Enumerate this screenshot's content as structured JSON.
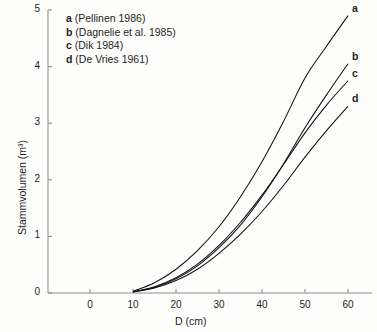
{
  "chart_data": {
    "type": "line",
    "title": "",
    "xlabel": "D (cm)",
    "ylabel": "Stammvolumen (m³)",
    "xlim": [
      0,
      65
    ],
    "ylim": [
      0,
      5
    ],
    "xticks": [
      0,
      10,
      20,
      30,
      40,
      50,
      60
    ],
    "yticks": [
      0,
      1,
      2,
      3,
      4,
      5
    ],
    "xtick_labels": [
      "0",
      "10",
      "20",
      "30",
      "40",
      "50",
      "60"
    ],
    "ytick_labels": [
      "0",
      "1",
      "2",
      "3",
      "4",
      "5"
    ],
    "grid": false,
    "legend_position": "upper-left",
    "x": [
      10,
      15,
      20,
      25,
      30,
      35,
      40,
      45,
      50,
      55,
      60
    ],
    "series": [
      {
        "name": "a",
        "label": "Pellinen 1986",
        "end_label": "a",
        "values": [
          0.03,
          0.18,
          0.42,
          0.75,
          1.17,
          1.7,
          2.32,
          3.03,
          3.8,
          4.36,
          4.9
        ]
      },
      {
        "name": "b",
        "label": "Dagnelie et al. 1985",
        "end_label": "b",
        "values": [
          0.02,
          0.1,
          0.25,
          0.48,
          0.8,
          1.2,
          1.7,
          2.28,
          2.92,
          3.5,
          4.05
        ]
      },
      {
        "name": "c",
        "label": "Dik 1984",
        "end_label": "c",
        "values": [
          0.02,
          0.11,
          0.27,
          0.51,
          0.84,
          1.25,
          1.73,
          2.27,
          2.83,
          3.32,
          3.75
        ]
      },
      {
        "name": "d",
        "label": "De Vries 1961",
        "end_label": "d",
        "values": [
          0.02,
          0.09,
          0.22,
          0.42,
          0.7,
          1.04,
          1.44,
          1.9,
          2.4,
          2.87,
          3.3
        ]
      }
    ]
  },
  "legend": {
    "entries": [
      {
        "key": "a",
        "ref": "(Pellinen 1986)"
      },
      {
        "key": "b",
        "ref": "(Dagnelie et al. 1985)"
      },
      {
        "key": "c",
        "ref": "(Dik 1984)"
      },
      {
        "key": "d",
        "ref": "(De Vries 1961)"
      }
    ]
  },
  "axes": {
    "y_title": "Stammvolumen (m³)",
    "x_title": "D (cm)"
  },
  "colors": {
    "curve": "#111111",
    "axis": "#8f8f8f",
    "text": "#1d1d1b",
    "background": "#fdfdfc"
  }
}
